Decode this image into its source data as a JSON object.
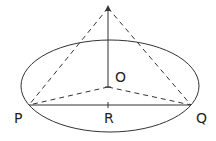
{
  "diagram": {
    "type": "geometry",
    "labels": {
      "O": "O",
      "P": "P",
      "Q": "Q",
      "R": "R"
    },
    "points": {
      "apex": [
        108,
        7
      ],
      "O": [
        108,
        87
      ],
      "P": [
        29,
        105
      ],
      "Q": [
        191,
        105
      ],
      "R": [
        108,
        105
      ]
    },
    "ellipse": {
      "cx": 110,
      "cy": 86,
      "rx": 89,
      "ry": 46
    },
    "colors": {
      "stroke": "#333333",
      "text": "#222222"
    }
  }
}
